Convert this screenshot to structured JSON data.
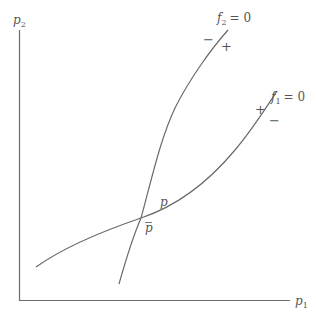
{
  "diagram": {
    "type": "phase-diagram",
    "axes": {
      "x_label": "p",
      "x_label_sub": "1",
      "y_label": "p",
      "y_label_sub": "2"
    },
    "curves": [
      {
        "id": "f2",
        "label_fn": "f",
        "label_sub": "2",
        "label_eq": "= 0",
        "sign_left": "−",
        "sign_right": "+"
      },
      {
        "id": "f1",
        "label_fn": "f",
        "label_sub": "1",
        "label_eq": "= 0",
        "sign_left": "+",
        "sign_right": "−"
      }
    ],
    "points": {
      "p": "p",
      "p_bar": "p"
    },
    "colors": {
      "line": "#6a6a6a",
      "text": "#555555",
      "background": "#ffffff"
    }
  }
}
